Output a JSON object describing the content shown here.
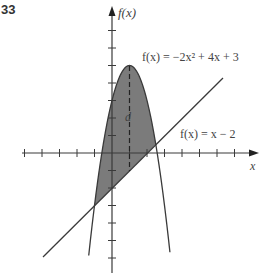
{
  "problem_number": "33",
  "chart_data": {
    "type": "line",
    "title": "",
    "xlabel": "x",
    "ylabel": "f(x)",
    "grid": false,
    "xlim": [
      -5,
      8
    ],
    "ylim": [
      -6,
      8
    ],
    "tick_spacing": 1,
    "series": [
      {
        "name": "f(x) = −2x² + 4x + 3",
        "expression": "-2x^2+4x+3",
        "vertex": [
          1,
          5
        ]
      },
      {
        "name": "f(x) = x − 2",
        "expression": "x-2"
      }
    ],
    "intersections": [
      [
        -1,
        -3
      ],
      [
        2.5,
        0.5
      ]
    ],
    "shaded_region": "between curves from x = -1 to x = 2.5",
    "annotations": [
      {
        "text": "d",
        "x": 1,
        "description": "dashed vertical segment at x = 1 from line to parabola vertex"
      }
    ],
    "colors": {
      "shade": "#7b7b7b",
      "line": "#3a3a3a"
    }
  },
  "labels": {
    "y_axis": "f(x)",
    "x_axis": "x",
    "parabola": "f(x) = −2x² + 4x + 3",
    "line": "f(x) = x − 2",
    "distance": "d"
  }
}
